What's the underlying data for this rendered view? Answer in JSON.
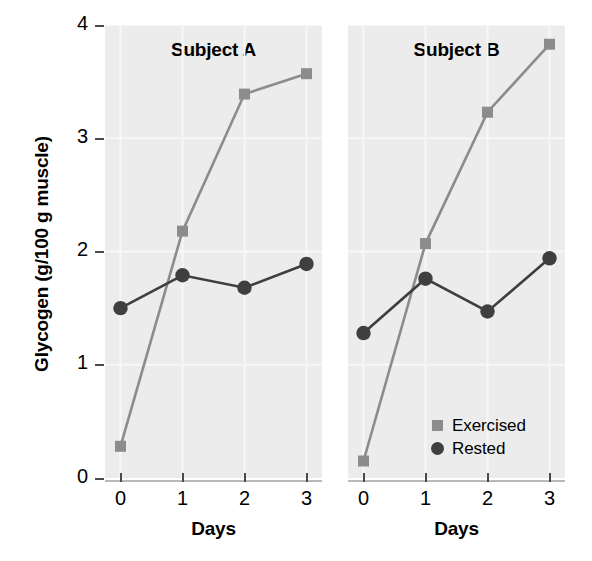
{
  "chart_data": {
    "type": "line",
    "title": "",
    "xlabel": "Days",
    "ylabel": "Glycogen (g/100 g muscle)",
    "x": [
      0,
      1,
      2,
      3
    ],
    "xticklabels": [
      "0",
      "1",
      "2",
      "3"
    ],
    "yticklabels": [
      "0",
      "1",
      "2",
      "3",
      "4"
    ],
    "yticks": [
      0,
      1,
      2,
      3,
      4
    ],
    "xlim": [
      -0.25,
      3.25
    ],
    "ylim": [
      0,
      4
    ],
    "grid": true,
    "legend_position": "bottom-right of right panel",
    "panels": [
      {
        "title": "Subject A",
        "series": [
          {
            "name": "Exercised",
            "marker": "square",
            "color": "#8c8c8c",
            "values": [
              0.28,
              2.18,
              3.39,
              3.57
            ]
          },
          {
            "name": "Rested",
            "marker": "circle",
            "color": "#3f3f3f",
            "values": [
              1.5,
              1.79,
              1.68,
              1.89
            ]
          }
        ]
      },
      {
        "title": "Subject B",
        "series": [
          {
            "name": "Exercised",
            "marker": "square",
            "color": "#8c8c8c",
            "values": [
              0.15,
              2.07,
              3.23,
              3.83
            ]
          },
          {
            "name": "Rested",
            "marker": "circle",
            "color": "#3f3f3f",
            "values": [
              1.28,
              1.76,
              1.47,
              1.94
            ]
          }
        ]
      }
    ],
    "legend": [
      {
        "label": "Exercised",
        "marker": "square",
        "color": "#8c8c8c"
      },
      {
        "label": "Rested",
        "marker": "circle",
        "color": "#3f3f3f"
      }
    ],
    "colors": {
      "exercised": "#8c8c8c",
      "rested": "#3f3f3f",
      "panel_background": "#ececec",
      "grid": "#f7f7f7",
      "axis": "#b9b9b9",
      "text": "#000000"
    }
  }
}
